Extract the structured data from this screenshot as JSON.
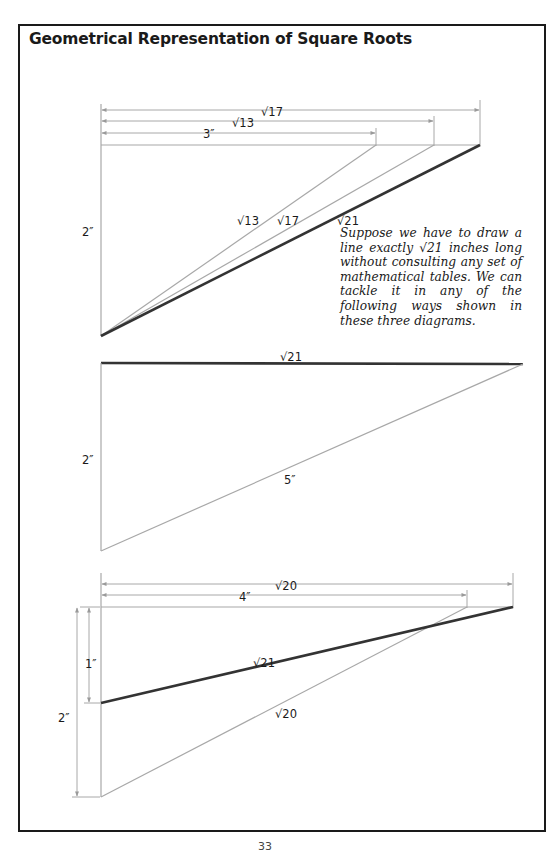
{
  "page": {
    "title": "Geometrical Representation of Square Roots",
    "page_number": "33",
    "explanation": "Suppose we have to draw a line exactly √21 inches long without consulting any set of mathematical tables. We can tackle it in any of the following ways shown in these three diagrams."
  },
  "colors": {
    "frame": "#1a1a1a",
    "thin_line": "#a8a8a8",
    "thick_line": "#333333",
    "text": "#1a1a1a"
  },
  "diagrams": [
    {
      "id": "diagram-1",
      "description": "Right triangle with vertical side 2\" and horizontal sides 3\", √13, √17; hypotenuses √13, √17, √21",
      "labels": {
        "top_dim_1": "√17",
        "top_dim_2": "√13",
        "top_dim_3": "3″",
        "vertical": "2″",
        "hyp_1": "√13",
        "hyp_2": "√17",
        "hyp_3": "√21"
      }
    },
    {
      "id": "diagram-2",
      "description": "Right triangle with leg 2\" and hypotenuse 5\", giving other leg √21",
      "labels": {
        "top": "√21",
        "vertical": "2″",
        "hypotenuse": "5″"
      }
    },
    {
      "id": "diagram-3",
      "description": "Horizontal 4\" and vertical 2\" give √20; √20 with 1\" gives √21",
      "labels": {
        "top_dim_1": "√20",
        "top_dim_2": "4″",
        "vertical_1": "1″",
        "vertical_2": "2″",
        "hyp_thick": "√21",
        "hyp_thin": "√20"
      }
    }
  ]
}
